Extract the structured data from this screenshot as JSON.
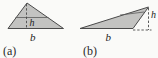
{
  "figure": {
    "panels": [
      {
        "id": "a",
        "caption": "(a)",
        "height_label": "h",
        "base_label": "b",
        "height_position": "inside",
        "shape": "acute-triangle"
      },
      {
        "id": "b",
        "caption": "(b)",
        "height_label": "h",
        "base_label": "b",
        "height_position": "outside-dashed",
        "shape": "obtuse-triangle"
      }
    ]
  },
  "colors": {
    "triangle_fill": "#c3c3c1",
    "outline": "#4a4a4a",
    "dashed_line": "#4a4a4a",
    "text": "#1d1d1d",
    "background": "#fafaf8"
  }
}
